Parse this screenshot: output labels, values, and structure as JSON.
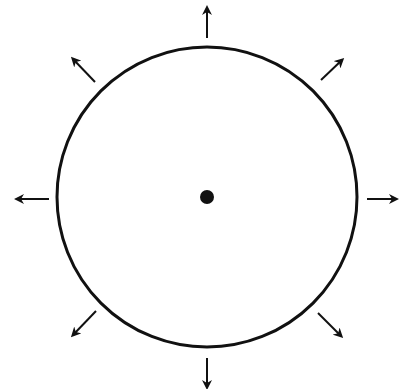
{
  "diagram": {
    "type": "radial-expansion",
    "canvas": {
      "width": 404,
      "height": 389,
      "background": "#ffffff"
    },
    "stroke_color": "#111111",
    "circle": {
      "cx": 207,
      "cy": 197,
      "r": 150,
      "stroke_width": 3
    },
    "center_dot": {
      "cx": 207,
      "cy": 197,
      "r": 7
    },
    "arrows": [
      {
        "direction": "up",
        "x1": 207,
        "y1": 38,
        "x2": 207,
        "y2": 8
      },
      {
        "direction": "up-right",
        "x1": 321,
        "y1": 80,
        "x2": 342,
        "y2": 60
      },
      {
        "direction": "right",
        "x1": 367,
        "y1": 199,
        "x2": 396,
        "y2": 199
      },
      {
        "direction": "down-right",
        "x1": 318,
        "y1": 313,
        "x2": 341,
        "y2": 336
      },
      {
        "direction": "down",
        "x1": 207,
        "y1": 358,
        "x2": 207,
        "y2": 387
      },
      {
        "direction": "down-left",
        "x1": 96,
        "y1": 311,
        "x2": 73,
        "y2": 335
      },
      {
        "direction": "left",
        "x1": 49,
        "y1": 199,
        "x2": 17,
        "y2": 199
      },
      {
        "direction": "up-left",
        "x1": 95,
        "y1": 82,
        "x2": 73,
        "y2": 59
      }
    ]
  }
}
